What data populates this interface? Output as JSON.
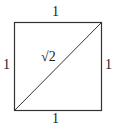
{
  "diagram": {
    "shape": "unit square with diagonal",
    "labels": {
      "top": "1",
      "bottom": "1",
      "left": "1",
      "right": "1",
      "diagonal": "√2"
    },
    "stroke_color": "#333333"
  }
}
